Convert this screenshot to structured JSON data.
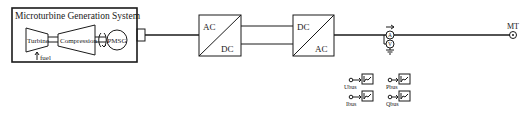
{
  "colors": {
    "line": "#1a1a1a",
    "background": "#ffffff"
  },
  "microturbine": {
    "title": "Microturbine Generation System",
    "turbine_label": "Turbine",
    "compressor_label": "Compression",
    "generator_label": "PMSG",
    "fuel_label": "fuel"
  },
  "rectifier": {
    "top_label": "AC",
    "bottom_label": "DC"
  },
  "inverter": {
    "top_label": "DC",
    "bottom_label": "AC"
  },
  "meter": {
    "current_symbol": "A",
    "voltage_symbol": "V"
  },
  "output_port": {
    "label": "MT"
  },
  "scopes": [
    {
      "label": "Ubus"
    },
    {
      "label": "Pbus"
    },
    {
      "label": "Ibus"
    },
    {
      "label": "Qbus"
    }
  ]
}
